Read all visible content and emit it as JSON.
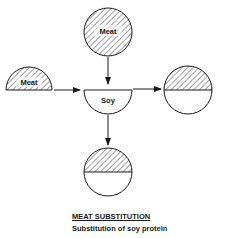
{
  "diagram": {
    "nodes": {
      "meat_whole": {
        "label": "Meat",
        "shape": "circle",
        "fill": "hatched"
      },
      "meat_half": {
        "label": "Meat",
        "shape": "half-circle-top",
        "fill": "hatched"
      },
      "soy": {
        "label": "Soy",
        "shape": "half-circle-bottom",
        "fill": "empty"
      },
      "result_right": {
        "label": "",
        "shape": "circle",
        "fill": "top-half-hatched"
      },
      "result_bottom": {
        "label": "",
        "shape": "circle",
        "fill": "top-half-hatched"
      }
    },
    "edges": [
      {
        "from": "meat_whole",
        "to": "soy"
      },
      {
        "from": "meat_half",
        "to": "soy"
      },
      {
        "from": "soy",
        "to": "result_right"
      },
      {
        "from": "soy",
        "to": "result_bottom"
      }
    ]
  },
  "caption": {
    "title": "MEAT SUBSTITUTION",
    "subtitle": "Substitution of soy protein"
  },
  "colors": {
    "stroke": "#1a1a1a",
    "background": "#ffffff"
  }
}
